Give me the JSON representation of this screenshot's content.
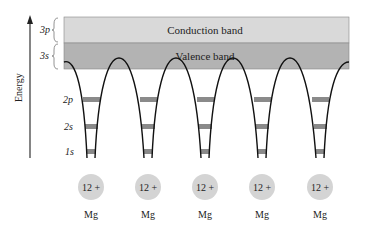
{
  "diagram": {
    "axis_label": "Energy",
    "bands": [
      {
        "name": "conduction",
        "label": "Conduction band",
        "orbital": "3p",
        "color": "#d9d9d9"
      },
      {
        "name": "valence",
        "label": "Valence band",
        "orbital": "3s",
        "color": "#b3b3b3"
      }
    ],
    "levels": [
      "2p",
      "2s",
      "1s"
    ],
    "level_color": "#8a8a8a",
    "ions": [
      {
        "charge": "12 +",
        "element": "Mg"
      },
      {
        "charge": "12 +",
        "element": "Mg"
      },
      {
        "charge": "12 +",
        "element": "Mg"
      },
      {
        "charge": "12 +",
        "element": "Mg"
      },
      {
        "charge": "12 +",
        "element": "Mg"
      }
    ],
    "ion_color": "#d4d4d4"
  }
}
